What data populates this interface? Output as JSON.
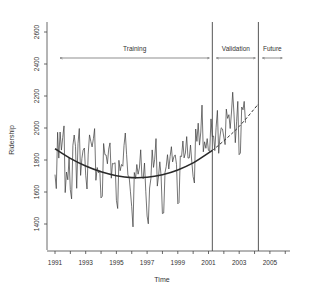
{
  "chart_data": {
    "type": "line",
    "title": "",
    "xlabel": "Time",
    "ylabel": "Ridership",
    "ylim": [
      1300,
      2700
    ],
    "xlim": [
      1990.6,
      2007.2
    ],
    "yticks": [
      1400,
      1600,
      1800,
      2000,
      2200,
      2400,
      2600
    ],
    "yticklabels": [
      "1400",
      "1600",
      "1800",
      "2000",
      "2200",
      "2400",
      "2600"
    ],
    "xticks_labeled": [
      1991,
      1993,
      1995,
      1997,
      1999,
      2001,
      2003,
      2005
    ],
    "xticklabels": [
      "1991",
      "1993",
      "1995",
      "1997",
      "1999",
      "2001",
      "2003",
      "2005"
    ],
    "grid": false,
    "legend": null,
    "partitions": [
      {
        "label": "Training",
        "from": 1991.0,
        "to": 2001.25
      },
      {
        "label": "Validation",
        "from": 2001.25,
        "to": 2004.25
      },
      {
        "label": "Future",
        "from": 2004.25,
        "to": 2006.0
      }
    ],
    "vertical_lines": [
      2001.25,
      2004.25
    ],
    "series": [
      {
        "name": "Ridership (monthly)",
        "style": "solid-thin",
        "start": 1991.0,
        "step": 0.0833,
        "values": [
          1709,
          1621,
          1973,
          1812,
          1975,
          1862,
          1940,
          2013,
          1596,
          1725,
          1676,
          1814,
          1615,
          1557,
          1891,
          1956,
          1885,
          1623,
          1903,
          1997,
          1704,
          1810,
          1862,
          1875,
          1705,
          1619,
          1837,
          1957,
          1917,
          1882,
          1933,
          1996,
          1673,
          1753,
          1720,
          1734,
          1563,
          1574,
          1903,
          1834,
          1831,
          1776,
          1868,
          1907,
          1686,
          1779,
          1776,
          1783,
          1548,
          1497,
          1798,
          1733,
          1772,
          1761,
          1890,
          1969,
          1833,
          1706,
          1691,
          1605,
          1508,
          1382,
          1722,
          1684,
          1772,
          1711,
          1750,
          1864,
          1697,
          1683,
          1781,
          1601,
          1450,
          1401,
          1625,
          1684,
          1863,
          1754,
          1805,
          1934,
          1637,
          1702,
          1789,
          1702,
          1465,
          1469,
          1722,
          1759,
          1833,
          1744,
          1821,
          1883,
          1788,
          1820,
          1832,
          1773,
          1526,
          1534,
          1825,
          1822,
          1919,
          1813,
          1844,
          1946,
          1812,
          1813,
          1894,
          1788,
          1697,
          1656,
          1994,
          1916,
          2030,
          1893,
          1975,
          2143,
          1851,
          1914,
          1873,
          1934,
          1861,
          1853,
          2057,
          1946,
          1950,
          1859,
          2004,
          2110,
          1842,
          1944,
          2001,
          1994,
          1944,
          1896,
          2118,
          2060,
          2083,
          1997,
          2100,
          2224,
          2087,
          1908,
          2039,
          2166,
          1833,
          1844,
          2131,
          2114,
          2166,
          2033
        ]
      },
      {
        "name": "Quadratic trend (training fit)",
        "style": "solid-thick",
        "x": [
          1991.0,
          1992.0,
          1993.0,
          1994.0,
          1995.0,
          1996.0,
          1997.0,
          1998.0,
          1999.0,
          2000.0,
          2001.25
        ],
        "values": [
          1870,
          1810,
          1762,
          1726,
          1702,
          1690,
          1692,
          1708,
          1738,
          1782,
          1860
        ]
      },
      {
        "name": "Trend forecast (validation)",
        "style": "dashed",
        "x": [
          2001.25,
          2002.0,
          2003.0,
          2004.25
        ],
        "values": [
          1860,
          1920,
          2010,
          2150
        ]
      }
    ]
  }
}
